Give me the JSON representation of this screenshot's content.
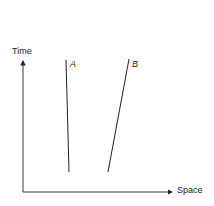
{
  "diagram": {
    "type": "spacetime",
    "axes": {
      "y_label": "Time",
      "x_label": "Space"
    },
    "worldlines": [
      {
        "label": "A",
        "from": [
          66,
          60
        ],
        "to": [
          69,
          172
        ]
      },
      {
        "label": "B",
        "from": [
          129,
          59
        ],
        "to": [
          108,
          172
        ]
      }
    ],
    "colors": {
      "line": "#222222",
      "background": "#ffffff"
    }
  }
}
